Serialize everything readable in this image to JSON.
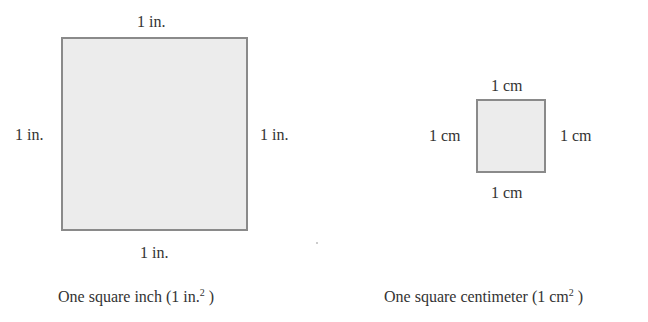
{
  "inch_figure": {
    "top_label": "1 in.",
    "left_label": "1 in.",
    "right_label": "1 in.",
    "bottom_label": "1 in.",
    "caption_prefix": "One square inch (1 in.",
    "caption_sup": "2",
    "caption_suffix": " )"
  },
  "cm_figure": {
    "top_label": "1 cm",
    "left_label": "1 cm",
    "right_label": "1 cm",
    "bottom_label": "1 cm",
    "caption_prefix": "One square centimeter (1 cm",
    "caption_sup": "2",
    "caption_suffix": " )"
  },
  "colors": {
    "fill": "#ececec",
    "border": "#8a8a8a",
    "text": "#333333"
  }
}
